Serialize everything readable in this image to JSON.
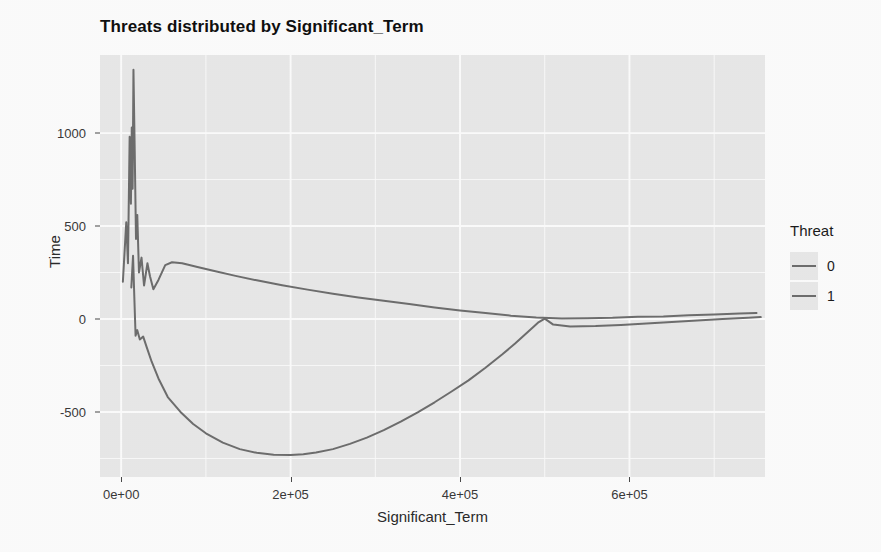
{
  "chart_data": {
    "type": "line",
    "title": "Threats distributed by Significant_Term",
    "xlabel": "Significant_Term",
    "ylabel": "Time",
    "xlim": [
      -25000,
      760000
    ],
    "ylim": [
      -850,
      1420
    ],
    "grid": true,
    "grid_color": "#ffffff",
    "panel_background": "#ebebeb",
    "legend": {
      "title": "Threat",
      "position": "right",
      "entries": [
        {
          "label": "0",
          "color": "#6f6f6f"
        },
        {
          "label": "1",
          "color": "#6f6f6f"
        }
      ]
    },
    "x_ticks": [
      {
        "value": 0,
        "label": "0e+00"
      },
      {
        "value": 200000,
        "label": "2e+05"
      },
      {
        "value": 400000,
        "label": "4e+05"
      },
      {
        "value": 600000,
        "label": "6e+05"
      }
    ],
    "y_ticks": [
      {
        "value": 1000,
        "label": "1000"
      },
      {
        "value": 500,
        "label": "500"
      },
      {
        "value": 0,
        "label": "0"
      },
      {
        "value": -500,
        "label": "-500"
      }
    ],
    "x_minor_gridlines": [
      100000,
      300000,
      500000,
      700000
    ],
    "y_minor_gridlines": [
      750,
      250,
      -250,
      -750
    ],
    "series": [
      {
        "name": "0",
        "color": "#6f6f6f",
        "points": [
          [
            2000,
            200
          ],
          [
            6000,
            520
          ],
          [
            8000,
            300
          ],
          [
            10000,
            980
          ],
          [
            11500,
            620
          ],
          [
            12500,
            1030
          ],
          [
            13500,
            700
          ],
          [
            14500,
            1340
          ],
          [
            16000,
            900
          ],
          [
            17500,
            430
          ],
          [
            19000,
            560
          ],
          [
            21000,
            250
          ],
          [
            24000,
            330
          ],
          [
            27000,
            180
          ],
          [
            31000,
            300
          ],
          [
            34000,
            230
          ],
          [
            38000,
            160
          ],
          [
            44000,
            210
          ],
          [
            52000,
            290
          ],
          [
            60000,
            305
          ],
          [
            72000,
            300
          ],
          [
            90000,
            280
          ],
          [
            110000,
            258
          ],
          [
            135000,
            232
          ],
          [
            160000,
            208
          ],
          [
            190000,
            182
          ],
          [
            220000,
            158
          ],
          [
            250000,
            136
          ],
          [
            280000,
            116
          ],
          [
            310000,
            98
          ],
          [
            340000,
            80
          ],
          [
            370000,
            62
          ],
          [
            400000,
            46
          ],
          [
            430000,
            32
          ],
          [
            460000,
            18
          ],
          [
            490000,
            8
          ],
          [
            520000,
            2
          ],
          [
            550000,
            4
          ],
          [
            580000,
            6
          ],
          [
            610000,
            12
          ],
          [
            640000,
            14
          ],
          [
            670000,
            20
          ],
          [
            700000,
            24
          ],
          [
            730000,
            30
          ],
          [
            750000,
            32
          ]
        ]
      },
      {
        "name": "1",
        "color": "#6f6f6f",
        "points": [
          [
            12000,
            170
          ],
          [
            14000,
            340
          ],
          [
            15500,
            120
          ],
          [
            17000,
            -90
          ],
          [
            19000,
            -60
          ],
          [
            22000,
            -110
          ],
          [
            26000,
            -95
          ],
          [
            30000,
            -150
          ],
          [
            36000,
            -230
          ],
          [
            44000,
            -320
          ],
          [
            55000,
            -420
          ],
          [
            70000,
            -500
          ],
          [
            85000,
            -565
          ],
          [
            100000,
            -615
          ],
          [
            120000,
            -665
          ],
          [
            140000,
            -700
          ],
          [
            160000,
            -720
          ],
          [
            180000,
            -730
          ],
          [
            200000,
            -732
          ],
          [
            215000,
            -728
          ],
          [
            230000,
            -718
          ],
          [
            250000,
            -700
          ],
          [
            270000,
            -672
          ],
          [
            290000,
            -638
          ],
          [
            310000,
            -598
          ],
          [
            330000,
            -552
          ],
          [
            350000,
            -502
          ],
          [
            370000,
            -448
          ],
          [
            390000,
            -390
          ],
          [
            410000,
            -330
          ],
          [
            430000,
            -262
          ],
          [
            450000,
            -190
          ],
          [
            465000,
            -132
          ],
          [
            480000,
            -70
          ],
          [
            492000,
            -20
          ],
          [
            500000,
            2
          ],
          [
            510000,
            -30
          ],
          [
            530000,
            -40
          ],
          [
            560000,
            -38
          ],
          [
            590000,
            -32
          ],
          [
            620000,
            -24
          ],
          [
            650000,
            -16
          ],
          [
            680000,
            -8
          ],
          [
            710000,
            0
          ],
          [
            740000,
            6
          ],
          [
            755000,
            10
          ]
        ]
      }
    ]
  }
}
